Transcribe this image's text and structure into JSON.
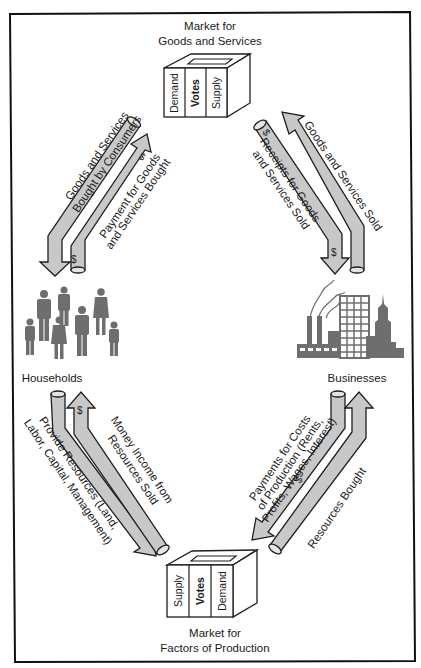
{
  "diagram": {
    "type": "circular-flow",
    "frame_color": "#111111",
    "pipe_fill": "#c8c8c8",
    "icon_color": "#6e6e6e",
    "markets": {
      "goods": {
        "title_line1": "Market for",
        "title_line2": "Goods and Services",
        "box_labels": [
          "Demand",
          "Votes",
          "Supply"
        ]
      },
      "factors": {
        "title_line1": "Market for",
        "title_line2": "Factors of Production",
        "box_labels": [
          "Supply",
          "Votes",
          "Demand"
        ]
      }
    },
    "nodes": {
      "households": {
        "label": "Households",
        "icon": "people-icon"
      },
      "businesses": {
        "label": "Businesses",
        "icon": "factory-city-icon"
      }
    },
    "flows": {
      "goods_bought": {
        "line1": "Goods and Services",
        "line2": "Bought by Consumers"
      },
      "payment_goods": {
        "line1": "Payment for Goods",
        "line2": "and Services Bought",
        "symbol": "$"
      },
      "goods_sold": {
        "line1": "Goods and Services Sold"
      },
      "receipts": {
        "line1": "Receipts for Goods",
        "line2": "and Services Sold",
        "symbol": "$"
      },
      "money_income": {
        "line1": "Money Income from",
        "line2": "Resources Sold",
        "symbol": "$"
      },
      "provide_resources": {
        "line1": "Provide Resources (Land,",
        "line2": "Labor, Capital, Management)"
      },
      "payments_costs": {
        "line1": "Payments for Costs",
        "line2": "of Production (Rents,",
        "line3": "Profits, Wages, Interest)",
        "symbol": "$"
      },
      "resources_bought": {
        "line1": "Resources Bought"
      }
    }
  }
}
